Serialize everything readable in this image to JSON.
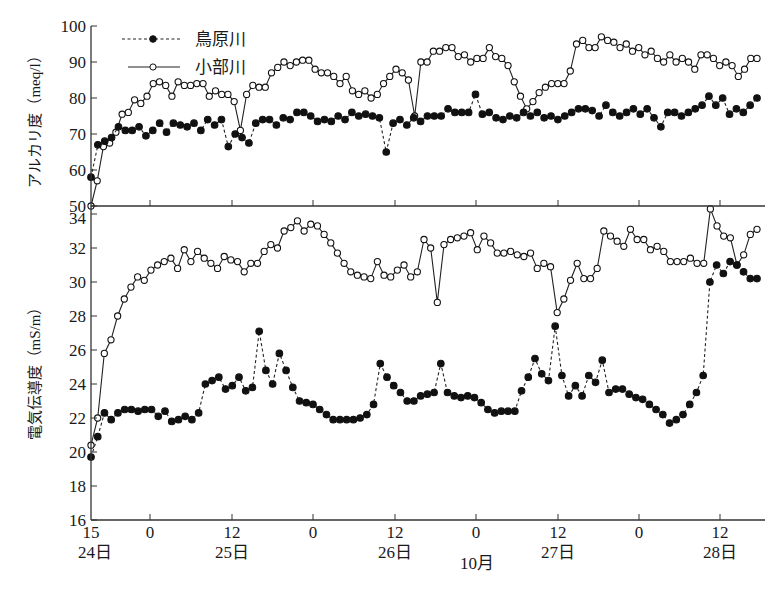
{
  "chart_data": [
    {
      "type": "line",
      "title": "",
      "ylabel": "アルカリ度 (meq/l)",
      "xlabel": "10月",
      "ylim": [
        50,
        100
      ],
      "yticks": [
        50,
        60,
        70,
        80,
        90,
        100
      ],
      "x_unit": "hours since 24日 15:00",
      "grid": false,
      "legend_position": "upper-left",
      "series": [
        {
          "name": "鳥原川",
          "style": "dashed, filled circle",
          "x": [
            0,
            1,
            3,
            5,
            7,
            9,
            11,
            13,
            15,
            17,
            19,
            21,
            23,
            25,
            27,
            29,
            31,
            33,
            35,
            37,
            39,
            41,
            43,
            45,
            47,
            49,
            51,
            53,
            55,
            57,
            59,
            61,
            63,
            65,
            67,
            69,
            71,
            73,
            75,
            77,
            79,
            81,
            83,
            85,
            87,
            89,
            91,
            93,
            95,
            97,
            99,
            101,
            103,
            105,
            107,
            109,
            111,
            113,
            115,
            117,
            119,
            121,
            123,
            125,
            127,
            129,
            131,
            133,
            135,
            137,
            139,
            141,
            143,
            145,
            147,
            149,
            151,
            153,
            155,
            157,
            159,
            161,
            163,
            165,
            167,
            169,
            171,
            173,
            175,
            177,
            179,
            181,
            183
          ],
          "values": [
            58,
            67,
            68,
            69,
            72,
            71,
            71,
            72,
            69.5,
            71,
            73,
            70.5,
            73,
            72.5,
            72,
            73,
            71,
            74,
            72.5,
            74,
            66.5,
            70,
            69,
            67.5,
            73,
            74,
            74,
            72.5,
            74.5,
            74,
            76,
            76,
            75,
            73.5,
            74,
            73.5,
            75,
            74,
            76,
            75,
            75.5,
            75,
            74.5,
            65,
            73,
            74,
            72.5,
            74.5,
            73.5,
            75,
            75,
            75,
            77,
            76,
            76,
            76,
            81,
            75.5,
            76,
            74.5,
            74,
            75,
            74.5,
            76,
            75,
            76,
            74.5,
            75,
            74,
            75,
            76,
            77,
            77,
            76.5,
            75,
            78,
            76,
            75,
            76,
            77,
            75.5,
            77,
            74.5,
            72,
            76,
            76,
            75,
            76,
            77,
            78,
            80.5,
            78,
            80,
            75.5,
            77,
            76,
            78,
            80
          ]
        },
        {
          "name": "小部川",
          "style": "solid, open circle",
          "x": [
            0,
            2,
            4,
            6,
            8,
            10,
            12,
            14,
            16,
            18,
            20,
            22,
            24,
            26,
            28,
            30,
            32,
            34,
            36,
            38,
            40,
            42,
            44,
            46,
            48,
            50,
            52,
            54,
            56,
            58,
            60,
            62,
            64,
            66,
            68,
            70,
            72,
            74,
            76,
            78,
            80,
            82,
            84,
            86,
            88,
            90,
            92,
            94,
            96,
            98,
            100,
            102,
            104,
            106,
            108,
            110,
            112,
            114,
            116,
            118,
            120,
            122,
            124,
            126,
            128,
            130,
            132,
            134,
            136,
            138,
            140,
            142,
            144,
            146,
            148,
            150,
            152,
            154,
            156,
            158,
            160,
            162,
            164,
            166,
            168,
            170,
            172,
            174,
            176,
            178,
            180,
            182,
            184
          ],
          "values": [
            50,
            57,
            66.5,
            67.5,
            70.5,
            75.5,
            76,
            79.5,
            78.5,
            80.5,
            84,
            84.5,
            83.5,
            80.5,
            84.5,
            83.5,
            83.5,
            84,
            84,
            80.5,
            82,
            81,
            81,
            79,
            71,
            81,
            83.5,
            83,
            83,
            87,
            88.5,
            90,
            89,
            90,
            90.5,
            90.5,
            88,
            87,
            87,
            86,
            84,
            86,
            82,
            81,
            82,
            80,
            81,
            84,
            86,
            88,
            87,
            85,
            75,
            90,
            90,
            93,
            93,
            94,
            94,
            91.5,
            92,
            90,
            91,
            91,
            94,
            91.5,
            91,
            89,
            84.5,
            80.5,
            77,
            79,
            81.5,
            83,
            84,
            84,
            84,
            87.5,
            95,
            96,
            94,
            94,
            97,
            96,
            95.5,
            94,
            95,
            93,
            94,
            92,
            93,
            91,
            90,
            92,
            90,
            91,
            90,
            88,
            92,
            92,
            91,
            89,
            90,
            89,
            86,
            88,
            91,
            91
          ]
        }
      ]
    },
    {
      "type": "line",
      "title": "",
      "ylabel": "電気伝導度 (mS/m)",
      "xlabel": "10月",
      "ylim": [
        16,
        34
      ],
      "yticks": [
        16,
        18,
        20,
        22,
        24,
        26,
        28,
        30,
        32,
        34
      ],
      "x_unit": "hours since 24日 15:00",
      "grid": false,
      "series": [
        {
          "name": "鳥原川",
          "style": "dashed, filled circle",
          "values": [
            19.7,
            20.9,
            22.3,
            21.9,
            22.3,
            22.5,
            22.5,
            22.4,
            22.5,
            22.5,
            22.1,
            22.4,
            21.8,
            21.9,
            22.1,
            21.9,
            22.3,
            24.0,
            24.2,
            24.4,
            23.7,
            23.9,
            24.4,
            23.6,
            23.8,
            27.1,
            24.8,
            24.0,
            25.8,
            24.8,
            23.8,
            23.0,
            22.9,
            22.8,
            22.5,
            22.2,
            21.9,
            21.9,
            21.9,
            21.9,
            22.0,
            22.2,
            22.8,
            25.2,
            24.4,
            23.9,
            23.5,
            23.0,
            23.0,
            23.3,
            23.4,
            23.5,
            25.2,
            23.5,
            23.3,
            23.2,
            23.3,
            23.2,
            22.9,
            22.5,
            22.3,
            22.4,
            22.4,
            22.4,
            23.6,
            24.4,
            25.5,
            24.6,
            24.2,
            27.4,
            24.5,
            23.3,
            23.9,
            23.3,
            24.5,
            24.1,
            25.4,
            23.5,
            23.7,
            23.7,
            23.4,
            23.2,
            23.1,
            22.8,
            22.5,
            22.2,
            21.7,
            21.9,
            22.2,
            22.8,
            23.5,
            24.5,
            30.0,
            31.0,
            30.5,
            31.2,
            31.0,
            30.6,
            30.2,
            30.2
          ]
        },
        {
          "name": "小部川",
          "style": "solid, open circle",
          "values": [
            20.4,
            22.0,
            25.8,
            26.6,
            28.0,
            29.0,
            29.7,
            30.3,
            30.1,
            30.7,
            31.0,
            31.2,
            31.4,
            30.8,
            31.9,
            31.2,
            31.8,
            31.4,
            31.1,
            30.8,
            31.5,
            31.3,
            31.2,
            30.6,
            31.1,
            31.1,
            31.8,
            32.2,
            32.0,
            33.0,
            33.2,
            33.6,
            33.0,
            33.4,
            33.3,
            32.8,
            32.3,
            31.7,
            31.1,
            30.6,
            30.4,
            30.3,
            30.2,
            31.2,
            30.4,
            30.3,
            30.7,
            31.0,
            30.3,
            30.6,
            32.5,
            32.0,
            28.8,
            32.2,
            32.5,
            32.6,
            32.7,
            32.9,
            31.9,
            32.7,
            32.3,
            31.7,
            31.7,
            31.8,
            31.6,
            31.5,
            31.7,
            30.8,
            31.1,
            30.9,
            28.2,
            29.0,
            30.1,
            31.1,
            30.2,
            30.2,
            30.8,
            33.0,
            32.7,
            32.4,
            32.1,
            33.1,
            32.5,
            32.5,
            31.9,
            32.1,
            31.8,
            31.2,
            31.2,
            31.2,
            31.4,
            31.1,
            31.1,
            34.3,
            33.3,
            32.7,
            32.6,
            31.0,
            31.6,
            32.8,
            33.1
          ]
        }
      ]
    }
  ],
  "legend": {
    "items": [
      {
        "label": "鳥原川",
        "style": "dashed-filled"
      },
      {
        "label": "小部川",
        "style": "solid-open"
      }
    ]
  },
  "axes": {
    "top": {
      "ylabel": "アルカリ度（meq/l）",
      "ticks": [
        "100",
        "90",
        "80",
        "70",
        "60",
        "50"
      ]
    },
    "bottom": {
      "ylabel": "電気伝導度（mS/m）",
      "ticks": [
        "34",
        "32",
        "30",
        "28",
        "26",
        "24",
        "22",
        "20",
        "18",
        "16"
      ]
    },
    "x": {
      "hour_ticks": [
        "15",
        "0",
        "12",
        "0",
        "12",
        "0",
        "12",
        "0",
        "12"
      ],
      "day_labels": [
        "24日",
        "25日",
        "26日",
        "27日",
        "28日"
      ],
      "month_label": "10月"
    }
  }
}
